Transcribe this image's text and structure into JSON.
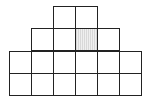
{
  "diagram": {
    "type": "square-grid-staircase",
    "cell_size": 22,
    "origin_x": 9,
    "origin_y": 6,
    "line_color": "#222222",
    "shade_color": "#dcdcdc",
    "rows": [
      {
        "row": 0,
        "start_col": 2,
        "count": 2
      },
      {
        "row": 1,
        "start_col": 1,
        "count": 4
      },
      {
        "row": 2,
        "start_col": 0,
        "count": 6
      },
      {
        "row": 3,
        "start_col": 0,
        "count": 6
      }
    ],
    "shaded_cells": [
      {
        "row": 1,
        "col": 3
      }
    ]
  }
}
